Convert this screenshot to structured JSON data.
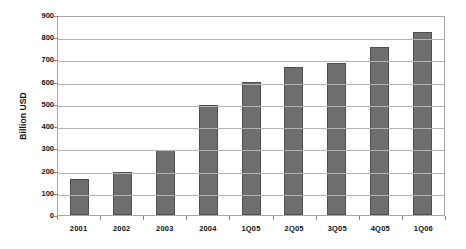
{
  "chart_data": {
    "type": "bar",
    "title": "",
    "subtitle": "",
    "xlabel": "",
    "ylabel": "Billion USD",
    "categories": [
      "2001",
      "2002",
      "2003",
      "2004",
      "1Q05",
      "2Q05",
      "3Q05",
      "4Q05",
      "1Q06"
    ],
    "values": [
      162,
      195,
      292,
      495,
      600,
      666,
      685,
      756,
      822
    ],
    "series": [
      {
        "name": "Billion USD",
        "values": [
          162,
          195,
          292,
          495,
          600,
          666,
          685,
          756,
          822
        ]
      }
    ],
    "ylim": [
      0,
      900
    ],
    "ytick_step": 100,
    "yticks": [
      "900",
      "800",
      "700",
      "600",
      "500",
      "400",
      "300",
      "200",
      "100",
      "0"
    ],
    "grid": true,
    "grid_axis": "y",
    "legend": false,
    "legend_position": "none",
    "bar_color": "#6e6e6e",
    "bar_edge_color": "#4f4f4f",
    "gridline_color": "#b4b4b4",
    "axis_color": "#a9a9a9",
    "text_color": "#111111",
    "background_color": "#ffffff"
  }
}
